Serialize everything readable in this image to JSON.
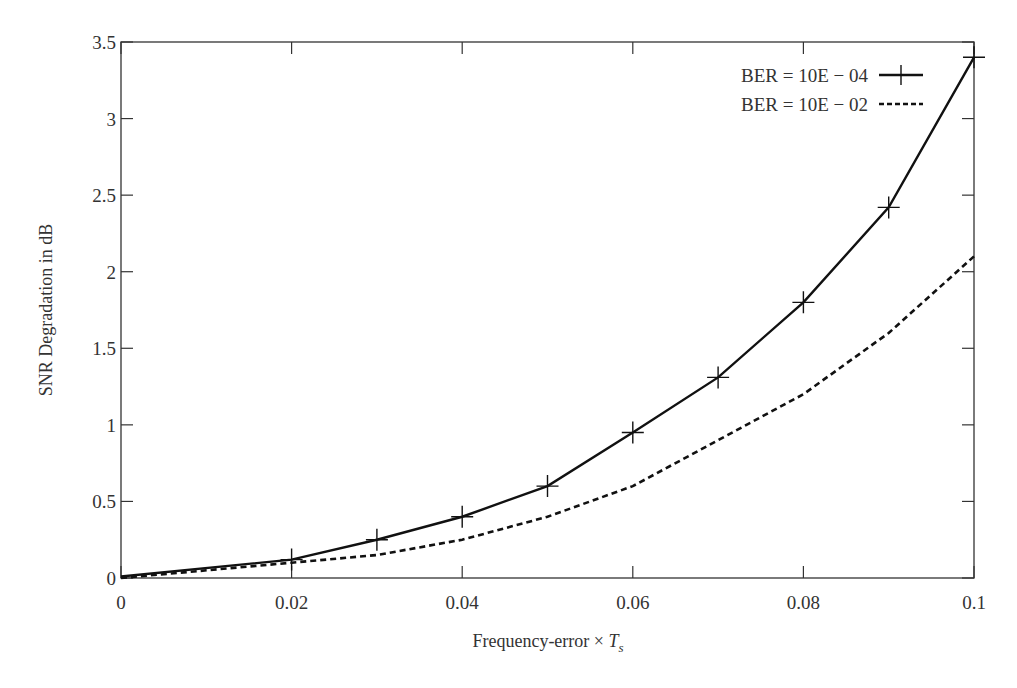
{
  "chart_data": {
    "type": "line",
    "title": "",
    "xlabel": "Frequency-error × T_s",
    "xlabel_main": "Frequency-error × ",
    "xlabel_var": "T",
    "xlabel_sub": "s",
    "ylabel": "SNR Degradation in dB",
    "xlim": [
      0,
      0.1
    ],
    "ylim": [
      0,
      3.5
    ],
    "xticks": [
      "0",
      "0.02",
      "0.04",
      "0.06",
      "0.08",
      "0.1"
    ],
    "yticks": [
      "0",
      "0.5",
      "1",
      "1.5",
      "2",
      "2.5",
      "3",
      "3.5"
    ],
    "grid": false,
    "legend_position": "upper right",
    "x": [
      0,
      0.02,
      0.03,
      0.04,
      0.05,
      0.06,
      0.07,
      0.08,
      0.09,
      0.1
    ],
    "series": [
      {
        "name": "BER = 10E − 04",
        "style": "solid-with-plus-markers",
        "values": [
          0.01,
          0.12,
          0.25,
          0.4,
          0.6,
          0.95,
          1.31,
          1.8,
          2.42,
          3.4
        ]
      },
      {
        "name": "BER = 10E − 02",
        "style": "dashed",
        "values": [
          0.0,
          0.1,
          0.15,
          0.25,
          0.4,
          0.6,
          0.9,
          1.2,
          1.6,
          2.1
        ]
      }
    ]
  }
}
